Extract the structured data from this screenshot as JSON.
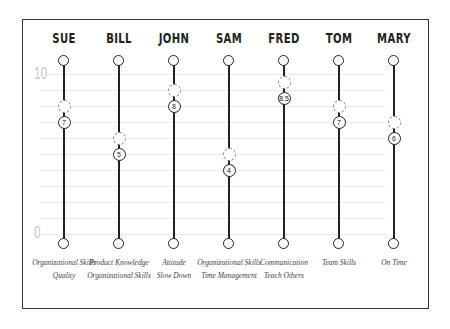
{
  "chart_data": {
    "type": "scatter",
    "title": "",
    "xlabel": "",
    "ylabel": "",
    "ylim": [
      0,
      10
    ],
    "scale_labels": {
      "top": "10",
      "bottom": "0"
    },
    "grid": true,
    "categories": [
      "SUE",
      "BILL",
      "JOHN",
      "SAM",
      "FRED",
      "TOM",
      "MARY"
    ],
    "series": [
      {
        "name": "current",
        "values": [
          7,
          5,
          8,
          4,
          8.5,
          7,
          6
        ],
        "labels": [
          "7",
          "5",
          "8",
          "4",
          "8.5",
          "7",
          "6"
        ]
      },
      {
        "name": "target",
        "values": [
          8,
          6,
          9,
          5,
          9.5,
          8,
          7
        ]
      }
    ],
    "annotations": [
      [
        "Organizational Skills",
        "Quality"
      ],
      [
        "Product Knowledge",
        "Organizational Skills"
      ],
      [
        "Attitude",
        "Slow Down"
      ],
      [
        "Organizational Skills",
        "Time Management"
      ],
      [
        "Communication",
        "Teach Others"
      ],
      [
        "Team Skills"
      ],
      [
        "On Time"
      ]
    ]
  },
  "people": [
    {
      "name": "SUE",
      "value": "7",
      "skills": [
        "Organizational Skills",
        "Quality"
      ]
    },
    {
      "name": "BILL",
      "value": "5",
      "skills": [
        "Product Knowledge",
        "Organizational Skills"
      ]
    },
    {
      "name": "JOHN",
      "value": "8",
      "skills": [
        "Attitude",
        "Slow Down"
      ]
    },
    {
      "name": "SAM",
      "value": "4",
      "skills": [
        "Organizational Skills",
        "Time Management"
      ]
    },
    {
      "name": "FRED",
      "value": "8.5",
      "skills": [
        "Communication",
        "Teach Others"
      ]
    },
    {
      "name": "TOM",
      "value": "7",
      "skills": [
        "Team Skills"
      ]
    },
    {
      "name": "MARY",
      "value": "6",
      "skills": [
        "On Time"
      ]
    }
  ],
  "scale": {
    "top": "10",
    "bottom": "0"
  }
}
